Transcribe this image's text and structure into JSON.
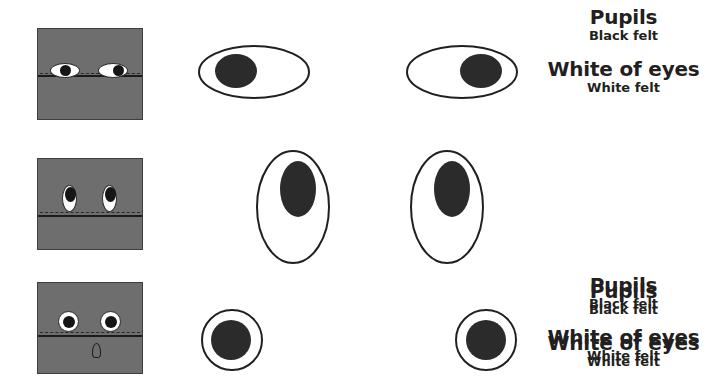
{
  "page": {
    "background_color": "#ffffff",
    "panel_color": "#6e6e6e",
    "ink_color": "#231f20",
    "pupil_color": "#151515",
    "white_color": "#ffffff"
  },
  "rows": [
    {
      "id": "row-almond",
      "eye_shape": "wide-horizontal-oval",
      "panel": {
        "name": "reference-panel",
        "eyes": [
          {
            "side": "left",
            "pupil_position": "right-of-center"
          },
          {
            "side": "right",
            "pupil_position": "right-of-center"
          }
        ],
        "seam": "horizontal-seam-line",
        "teardrop": false
      },
      "pieces": [
        {
          "name": "left-eye-piece",
          "outline": "horizontal-ellipse",
          "pupil_position": "left"
        },
        {
          "name": "right-eye-piece",
          "outline": "horizontal-ellipse",
          "pupil_position": "right"
        }
      ],
      "legend": {
        "pupils_label": "Pupils",
        "pupils_material": "Black felt",
        "white_label": "White of eyes",
        "white_material": "White felt"
      }
    },
    {
      "id": "row-tall",
      "eye_shape": "tall-vertical-oval",
      "panel": {
        "name": "reference-panel",
        "eyes": [
          {
            "side": "left",
            "pupil_position": "top"
          },
          {
            "side": "right",
            "pupil_position": "top"
          }
        ],
        "seam": "horizontal-seam-line",
        "teardrop": false
      },
      "pieces": [
        {
          "name": "left-eye-piece",
          "outline": "vertical-ellipse",
          "pupil_position": "top"
        },
        {
          "name": "right-eye-piece",
          "outline": "vertical-ellipse",
          "pupil_position": "top"
        }
      ],
      "legend": {
        "pupils_label": "Pupils",
        "pupils_material": "Black felt",
        "white_label": "White of eyes",
        "white_material": "White felt"
      }
    },
    {
      "id": "row-round",
      "eye_shape": "round",
      "panel": {
        "name": "reference-panel",
        "eyes": [
          {
            "side": "left",
            "pupil_position": "center"
          },
          {
            "side": "right",
            "pupil_position": "center"
          }
        ],
        "seam": "horizontal-seam-line",
        "teardrop": true
      },
      "pieces": [
        {
          "name": "left-eye-piece",
          "outline": "circle",
          "pupil_position": "center"
        },
        {
          "name": "right-eye-piece",
          "outline": "circle",
          "pupil_position": "center"
        }
      ],
      "legend": {
        "pupils_label": "Pupils",
        "pupils_material": "Black felt",
        "white_label": "White of eyes",
        "white_material": "White felt"
      }
    }
  ]
}
